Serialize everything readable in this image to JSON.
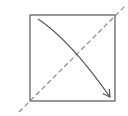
{
  "diagram": {
    "width": 128,
    "height": 116,
    "background": "#ffffff",
    "square": {
      "x": 30,
      "y": 15,
      "width": 85,
      "height": 86,
      "stroke": "#555555",
      "stroke_width": 1.2
    },
    "dashed_line": {
      "x1": 19,
      "y1": 112,
      "x2": 125,
      "y2": 6,
      "stroke": "#888888",
      "stroke_width": 1.2,
      "dash": "5,3"
    },
    "curved_arrow": {
      "path": "M38 19 Q 70 40 110 97",
      "stroke": "#555555",
      "stroke_width": 1.2,
      "arrowhead": "open"
    }
  }
}
